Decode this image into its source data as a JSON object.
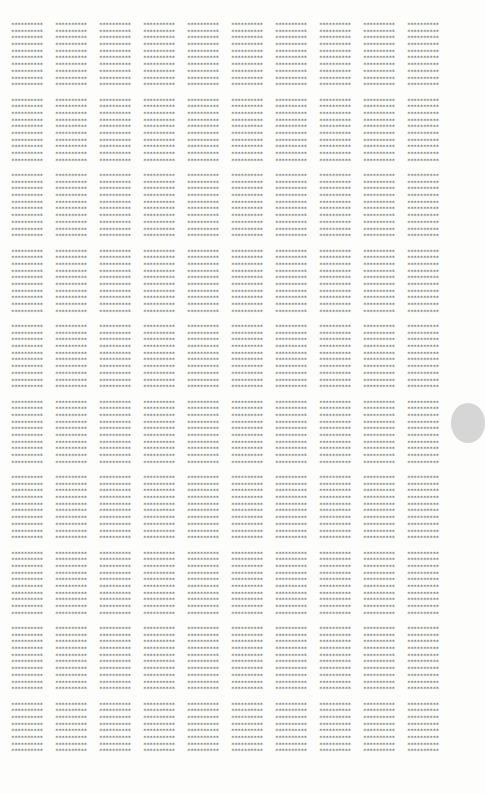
{
  "document": {
    "block_columns": 10,
    "block_rows": 10,
    "lines_per_block": 10,
    "last_row_visible_lines": 8,
    "line_text": "**********",
    "text_color": "#555555",
    "background": "#fdfdfc"
  },
  "scroll_handle": {
    "color": "#d6d6d6"
  }
}
